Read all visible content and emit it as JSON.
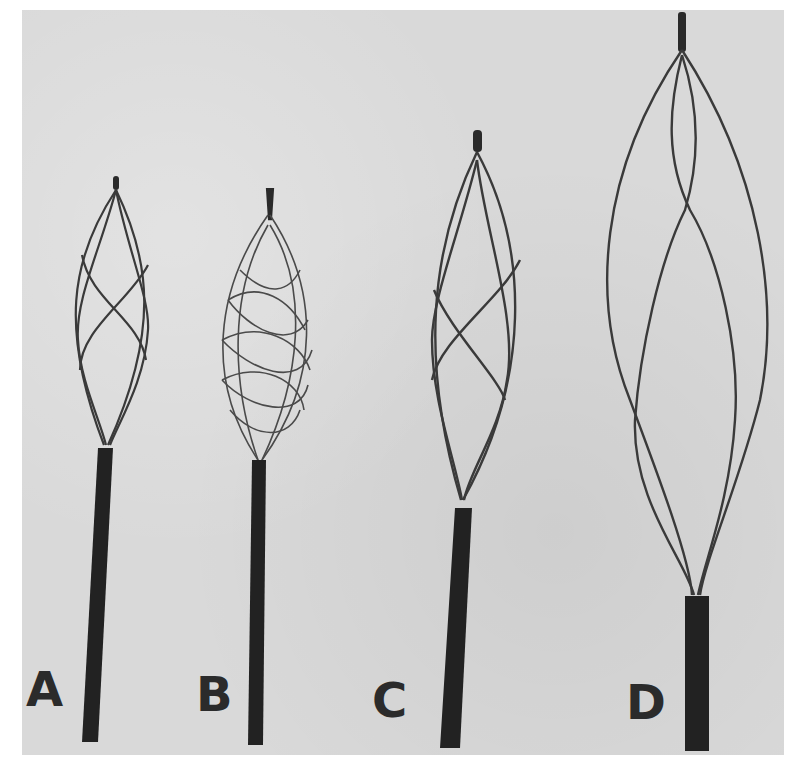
{
  "figure": {
    "background_color": "#d9d9d9",
    "wire_color": "#3a3a3a",
    "sheath_color": "#222222",
    "baskets": [
      {
        "label": "A",
        "type": "4-wire helical basket, small"
      },
      {
        "label": "B",
        "type": "multi-wire mesh basket, small"
      },
      {
        "label": "C",
        "type": "4-wire helical basket, medium"
      },
      {
        "label": "D",
        "type": "4-wire helical basket, large"
      }
    ]
  }
}
